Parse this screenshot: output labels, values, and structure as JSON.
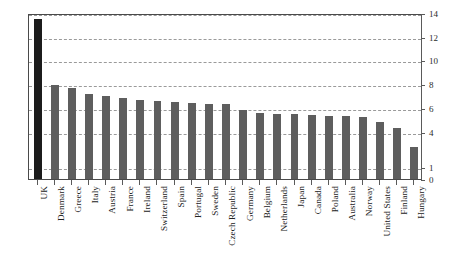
{
  "chart_data": {
    "type": "bar",
    "title": "",
    "subtitle": "",
    "xlabel": "",
    "ylabel": "",
    "ylim": [
      0,
      14
    ],
    "yticks": [
      0,
      1,
      4,
      6,
      8,
      10,
      12,
      14
    ],
    "ytick_labels": [
      "0",
      "1",
      "4",
      "6",
      "8",
      "10",
      "12",
      "14"
    ],
    "grid": true,
    "grid_axis": "y",
    "legend": "none",
    "y_axis_position": "right",
    "categories": [
      "UK",
      "Denmark",
      "Greece",
      "Italy",
      "Austria",
      "France",
      "Ireland",
      "Switzerland",
      "Spain",
      "Portugal",
      "Sweden",
      "Czech Republic",
      "Germany",
      "Belgium",
      "Netherlands",
      "Japan",
      "Canada",
      "Poland",
      "Australia",
      "Norway",
      "United States",
      "Finland",
      "Hungary"
    ],
    "values": [
      13.5,
      7.9,
      7.7,
      7.2,
      7.0,
      6.8,
      6.7,
      6.6,
      6.5,
      6.4,
      6.3,
      6.3,
      5.8,
      5.6,
      5.5,
      5.5,
      5.4,
      5.3,
      5.3,
      5.2,
      4.8,
      4.3,
      2.7
    ],
    "bar_colors": {
      "default": "#5e5e5e",
      "highlight": "#1c1c1c"
    },
    "highlight_index": 0
  }
}
